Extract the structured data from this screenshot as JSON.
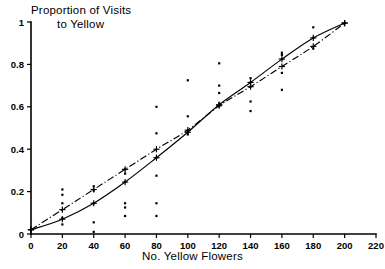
{
  "chart_data": {
    "type": "scatter",
    "title": "Proportion of Visits to Yellow",
    "title_line1": "Proportion of Visits",
    "title_line2": "to Yellow",
    "xlabel": "No. Yellow Flowers",
    "ylabel": "Proportion of Visits to Yellow",
    "xlim": [
      0,
      220
    ],
    "ylim": [
      0,
      1
    ],
    "xticks": [
      0,
      20,
      40,
      60,
      80,
      100,
      120,
      140,
      160,
      180,
      200,
      220
    ],
    "xticklabels": [
      "0",
      "20",
      "40",
      "60",
      "80",
      "100",
      "120",
      "140",
      "160",
      "180",
      "200",
      "220"
    ],
    "yticks": [
      0,
      0.2,
      0.4,
      0.6,
      0.8,
      1
    ],
    "yticklabels": [
      "0",
      "0.2",
      "0.4",
      "0.6",
      "0.8",
      "1"
    ],
    "grid": false,
    "legend": "none",
    "scatter_points": [
      {
        "x": 0,
        "y": 0.02
      },
      {
        "x": 20,
        "y": 0.21
      },
      {
        "x": 20,
        "y": 0.185
      },
      {
        "x": 20,
        "y": 0.145
      },
      {
        "x": 20,
        "y": 0.075
      },
      {
        "x": 20,
        "y": 0.045
      },
      {
        "x": 40,
        "y": 0.225
      },
      {
        "x": 40,
        "y": 0.205
      },
      {
        "x": 40,
        "y": 0.145
      },
      {
        "x": 40,
        "y": 0.055
      },
      {
        "x": 40,
        "y": 0.01
      },
      {
        "x": 60,
        "y": 0.305
      },
      {
        "x": 60,
        "y": 0.285
      },
      {
        "x": 60,
        "y": 0.245
      },
      {
        "x": 60,
        "y": 0.145
      },
      {
        "x": 60,
        "y": 0.125
      },
      {
        "x": 60,
        "y": 0.085
      },
      {
        "x": 80,
        "y": 0.6
      },
      {
        "x": 80,
        "y": 0.475
      },
      {
        "x": 80,
        "y": 0.36
      },
      {
        "x": 80,
        "y": 0.275
      },
      {
        "x": 80,
        "y": 0.145
      },
      {
        "x": 80,
        "y": 0.085
      },
      {
        "x": 100,
        "y": 0.725
      },
      {
        "x": 100,
        "y": 0.555
      },
      {
        "x": 100,
        "y": 0.485
      },
      {
        "x": 100,
        "y": 0.47
      },
      {
        "x": 120,
        "y": 0.805
      },
      {
        "x": 120,
        "y": 0.7
      },
      {
        "x": 120,
        "y": 0.665
      },
      {
        "x": 120,
        "y": 0.615
      },
      {
        "x": 120,
        "y": 0.605
      },
      {
        "x": 140,
        "y": 0.735
      },
      {
        "x": 140,
        "y": 0.715
      },
      {
        "x": 140,
        "y": 0.695
      },
      {
        "x": 140,
        "y": 0.625
      },
      {
        "x": 140,
        "y": 0.58
      },
      {
        "x": 160,
        "y": 0.855
      },
      {
        "x": 160,
        "y": 0.845
      },
      {
        "x": 160,
        "y": 0.825
      },
      {
        "x": 160,
        "y": 0.76
      },
      {
        "x": 160,
        "y": 0.68
      },
      {
        "x": 180,
        "y": 0.975
      },
      {
        "x": 180,
        "y": 0.925
      },
      {
        "x": 180,
        "y": 0.875
      },
      {
        "x": 200,
        "y": 0.995
      }
    ],
    "series": [
      {
        "name": "solid-curve",
        "style": "solid",
        "marker": "plus",
        "x": [
          0,
          20,
          40,
          60,
          80,
          100,
          120,
          140,
          160,
          180,
          200
        ],
        "y": [
          0.02,
          0.07,
          0.145,
          0.245,
          0.36,
          0.48,
          0.61,
          0.715,
          0.825,
          0.925,
          0.995
        ]
      },
      {
        "name": "dash-dot-curve",
        "style": "dash-dot",
        "marker": "plus",
        "x": [
          0,
          20,
          40,
          60,
          80,
          100,
          120,
          140,
          160,
          180,
          200
        ],
        "y": [
          0.02,
          0.115,
          0.21,
          0.305,
          0.4,
          0.49,
          0.605,
          0.695,
          0.79,
          0.885,
          0.995
        ]
      }
    ]
  }
}
